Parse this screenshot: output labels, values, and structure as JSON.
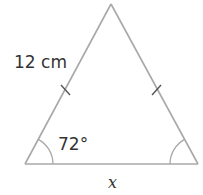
{
  "diagram": {
    "type": "isosceles-triangle",
    "side_label": "12 cm",
    "angle_label": "72°",
    "base_label": "x",
    "colors": {
      "line": "#a8a8a8",
      "text": "#333333",
      "background": "#ffffff"
    },
    "vertices": {
      "apex": [
        111,
        4
      ],
      "bottom_left": [
        25,
        164
      ],
      "bottom_right": [
        198,
        164
      ]
    },
    "equal_side_marks": 2,
    "base_angle_arcs": 2
  }
}
